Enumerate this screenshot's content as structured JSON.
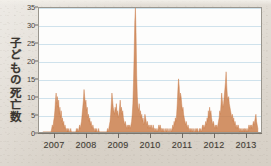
{
  "chart_data": {
    "type": "area",
    "title": "",
    "subtitle": "",
    "xlabel": "",
    "ylabel": "子どもの死亡数",
    "xlim": [
      2006.5,
      2013.5
    ],
    "ylim": [
      0,
      35
    ],
    "grid": true,
    "legend_position": "none",
    "series_color": "#c87a45",
    "gridline_color": "#cfe2ec",
    "plot_background": "#fdfdfc",
    "paper_background": "#ddd7cf",
    "y_ticks": [
      0,
      5,
      10,
      15,
      20,
      25,
      30,
      35
    ],
    "y_tick_labels": [
      "0",
      "5",
      "10",
      "15",
      "20",
      "25",
      "30",
      "35"
    ],
    "x_ticks": [
      2007,
      2008,
      2009,
      2010,
      2011,
      2012,
      2013
    ],
    "x_tick_labels": [
      "2007",
      "2008",
      "2009",
      "2010",
      "2011",
      "2012",
      "2013"
    ],
    "series": [
      {
        "name": "子どもの死亡数",
        "x": [
          2006.62,
          2006.64,
          2006.66,
          2006.68,
          2006.7,
          2006.72,
          2006.74,
          2006.76,
          2006.78,
          2006.8,
          2006.82,
          2006.84,
          2006.86,
          2006.88,
          2006.9,
          2006.92,
          2006.94,
          2006.96,
          2006.98,
          2007.0,
          2007.02,
          2007.04,
          2007.06,
          2007.08,
          2007.1,
          2007.12,
          2007.14,
          2007.16,
          2007.18,
          2007.2,
          2007.22,
          2007.24,
          2007.26,
          2007.28,
          2007.3,
          2007.32,
          2007.34,
          2007.36,
          2007.38,
          2007.4,
          2007.42,
          2007.44,
          2007.46,
          2007.48,
          2007.5,
          2007.52,
          2007.54,
          2007.56,
          2007.58,
          2007.6,
          2007.62,
          2007.64,
          2007.66,
          2007.68,
          2007.7,
          2007.72,
          2007.74,
          2007.76,
          2007.78,
          2007.8,
          2007.82,
          2007.84,
          2007.86,
          2007.88,
          2007.9,
          2007.92,
          2007.94,
          2007.96,
          2007.98,
          2008.0,
          2008.02,
          2008.04,
          2008.06,
          2008.08,
          2008.1,
          2008.12,
          2008.14,
          2008.16,
          2008.18,
          2008.2,
          2008.22,
          2008.24,
          2008.26,
          2008.28,
          2008.3,
          2008.32,
          2008.34,
          2008.36,
          2008.38,
          2008.4,
          2008.42,
          2008.44,
          2008.46,
          2008.48,
          2008.5,
          2008.52,
          2008.54,
          2008.56,
          2008.58,
          2008.6,
          2008.62,
          2008.64,
          2008.66,
          2008.68,
          2008.7,
          2008.72,
          2008.74,
          2008.76,
          2008.78,
          2008.8,
          2008.82,
          2008.84,
          2008.86,
          2008.88,
          2008.9,
          2008.92,
          2008.94,
          2008.96,
          2008.98,
          2009.0,
          2009.02,
          2009.04,
          2009.06,
          2009.08,
          2009.1,
          2009.12,
          2009.14,
          2009.16,
          2009.18,
          2009.2,
          2009.22,
          2009.24,
          2009.26,
          2009.28,
          2009.3,
          2009.32,
          2009.34,
          2009.36,
          2009.38,
          2009.4,
          2009.42,
          2009.44,
          2009.46,
          2009.48,
          2009.5,
          2009.52,
          2009.54,
          2009.56,
          2009.58,
          2009.6,
          2009.62,
          2009.64,
          2009.66,
          2009.68,
          2009.7,
          2009.72,
          2009.74,
          2009.76,
          2009.78,
          2009.8,
          2009.82,
          2009.84,
          2009.86,
          2009.88,
          2009.9,
          2009.92,
          2009.94,
          2009.96,
          2009.98,
          2010.0,
          2010.02,
          2010.04,
          2010.06,
          2010.08,
          2010.1,
          2010.12,
          2010.14,
          2010.16,
          2010.18,
          2010.2,
          2010.22,
          2010.24,
          2010.26,
          2010.28,
          2010.3,
          2010.32,
          2010.34,
          2010.36,
          2010.38,
          2010.4,
          2010.42,
          2010.44,
          2010.46,
          2010.48,
          2010.5,
          2010.52,
          2010.54,
          2010.56,
          2010.58,
          2010.6,
          2010.62,
          2010.64,
          2010.66,
          2010.68,
          2010.7,
          2010.72,
          2010.74,
          2010.76,
          2010.78,
          2010.8,
          2010.82,
          2010.84,
          2010.86,
          2010.88,
          2010.9,
          2010.92,
          2010.94,
          2010.96,
          2010.98,
          2011.0,
          2011.02,
          2011.04,
          2011.06,
          2011.08,
          2011.1,
          2011.12,
          2011.14,
          2011.16,
          2011.18,
          2011.2,
          2011.22,
          2011.24,
          2011.26,
          2011.28,
          2011.3,
          2011.32,
          2011.34,
          2011.36,
          2011.38,
          2011.4,
          2011.42,
          2011.44,
          2011.46,
          2011.48,
          2011.5,
          2011.52,
          2011.54,
          2011.56,
          2011.58,
          2011.6,
          2011.62,
          2011.64,
          2011.66,
          2011.68,
          2011.7,
          2011.72,
          2011.74,
          2011.76,
          2011.78,
          2011.8,
          2011.82,
          2011.84,
          2011.86,
          2011.88,
          2011.9,
          2011.92,
          2011.94,
          2011.96,
          2011.98,
          2012.0,
          2012.02,
          2012.04,
          2012.06,
          2012.08,
          2012.1,
          2012.12,
          2012.14,
          2012.16,
          2012.18,
          2012.2,
          2012.22,
          2012.24,
          2012.26,
          2012.28,
          2012.3,
          2012.32,
          2012.34,
          2012.36,
          2012.38,
          2012.4,
          2012.42,
          2012.44,
          2012.46,
          2012.48,
          2012.5,
          2012.52,
          2012.54,
          2012.56,
          2012.58,
          2012.6,
          2012.62,
          2012.64,
          2012.66,
          2012.68,
          2012.7,
          2012.72,
          2012.74,
          2012.76,
          2012.78,
          2012.8,
          2012.82,
          2012.84,
          2012.86,
          2012.88,
          2012.9,
          2012.92,
          2012.94,
          2012.96,
          2012.98,
          2013.0,
          2013.02,
          2013.04,
          2013.06,
          2013.08,
          2013.1,
          2013.12,
          2013.14,
          2013.16,
          2013.18,
          2013.2,
          2013.22,
          2013.24,
          2013.26,
          2013.28,
          2013.3,
          2013.32,
          2013.34,
          2013.36,
          2013.38,
          2013.4
        ],
        "values": [
          0,
          0,
          0,
          0,
          0,
          0,
          0,
          0,
          0,
          0,
          0,
          0,
          0,
          0,
          1,
          2,
          1,
          3,
          4,
          6,
          9,
          11,
          8,
          10,
          7,
          9,
          5,
          7,
          4,
          6,
          3,
          4,
          2,
          3,
          1,
          2,
          1,
          1,
          0,
          1,
          0,
          1,
          0,
          0,
          1,
          0,
          0,
          0,
          0,
          0,
          0,
          0,
          0,
          1,
          0,
          1,
          0,
          1,
          2,
          1,
          2,
          3,
          5,
          7,
          9,
          12,
          10,
          8,
          9,
          6,
          7,
          4,
          5,
          3,
          4,
          2,
          3,
          2,
          1,
          2,
          1,
          1,
          0,
          1,
          0,
          1,
          0,
          0,
          1,
          0,
          0,
          0,
          0,
          0,
          0,
          0,
          0,
          0,
          0,
          0,
          0,
          0,
          1,
          0,
          1,
          2,
          3,
          5,
          8,
          11,
          9,
          7,
          6,
          5,
          7,
          6,
          8,
          5,
          6,
          4,
          5,
          7,
          9,
          6,
          7,
          5,
          6,
          4,
          3,
          2,
          3,
          2,
          1,
          2,
          1,
          2,
          1,
          2,
          1,
          2,
          3,
          5,
          8,
          14,
          22,
          31,
          35,
          28,
          16,
          10,
          7,
          6,
          8,
          5,
          6,
          4,
          5,
          3,
          4,
          2,
          3,
          5,
          4,
          3,
          2,
          3,
          1,
          2,
          1,
          2,
          1,
          2,
          1,
          1,
          2,
          1,
          1,
          0,
          1,
          0,
          1,
          0,
          1,
          2,
          1,
          2,
          1,
          1,
          0,
          1,
          0,
          1,
          0,
          0,
          1,
          0,
          1,
          0,
          0,
          1,
          0,
          0,
          1,
          0,
          1,
          2,
          1,
          3,
          2,
          4,
          3,
          5,
          8,
          12,
          15,
          13,
          9,
          11,
          10,
          8,
          6,
          7,
          5,
          4,
          3,
          2,
          3,
          2,
          1,
          2,
          1,
          1,
          0,
          1,
          0,
          1,
          0,
          1,
          0,
          0,
          1,
          0,
          1,
          0,
          1,
          0,
          0,
          1,
          0,
          1,
          0,
          1,
          2,
          1,
          2,
          1,
          2,
          3,
          2,
          4,
          3,
          6,
          4,
          7,
          5,
          6,
          4,
          3,
          2,
          3,
          2,
          1,
          2,
          1,
          2,
          1,
          2,
          3,
          4,
          6,
          5,
          8,
          11,
          9,
          7,
          8,
          10,
          12,
          14,
          17,
          13,
          10,
          9,
          10,
          8,
          7,
          6,
          5,
          4,
          5,
          3,
          4,
          2,
          3,
          2,
          1,
          2,
          1,
          2,
          1,
          1,
          0,
          1,
          0,
          1,
          0,
          1,
          0,
          1,
          0,
          1,
          0,
          1,
          0,
          1,
          2,
          1,
          2,
          1,
          2,
          1,
          2,
          3,
          2,
          3,
          4,
          5,
          3,
          2,
          1
        ]
      }
    ],
    "notes": [
      "週単位の子どもの死亡数の推移（2007年〜2013年）",
      "2009年に最大値35を記録"
    ]
  },
  "axes": {
    "y_title": "子どもの死亡数"
  }
}
